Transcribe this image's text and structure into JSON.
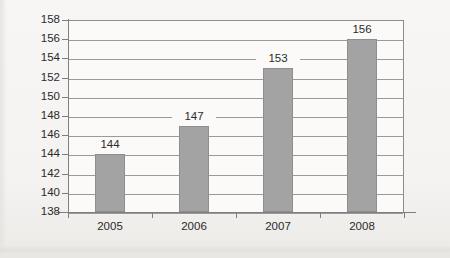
{
  "chart_data": {
    "type": "bar",
    "title": "",
    "subtitle": "",
    "xlabel": "",
    "ylabel": "",
    "categories": [
      "2005",
      "2006",
      "2007",
      "2008"
    ],
    "values": [
      144,
      147,
      153,
      156
    ],
    "value_labels": [
      "144",
      "147",
      "153",
      "156"
    ],
    "series": [
      {
        "name": "",
        "values": [
          144,
          147,
          153,
          156
        ]
      }
    ],
    "ylim": [
      138,
      158
    ],
    "ytick_step": 2,
    "ytick_labels": [
      "158",
      "156",
      "154",
      "152",
      "150",
      "148",
      "146",
      "144",
      "142",
      "140",
      "138"
    ],
    "ytick_values": [
      158,
      156,
      154,
      152,
      150,
      148,
      146,
      144,
      142,
      140,
      138
    ],
    "grid": true,
    "grid_axis": "y",
    "legend": false,
    "legend_position": "none",
    "bar_color": "#a3a3a3",
    "bar_border_color": "#8e8e8e",
    "grid_color": "#9a9a9a",
    "axis_color": "#7e7e7e",
    "plot_background": "#fbfaf9",
    "page_background": "#f6f5f3",
    "text_color": "#2a2a2a"
  }
}
